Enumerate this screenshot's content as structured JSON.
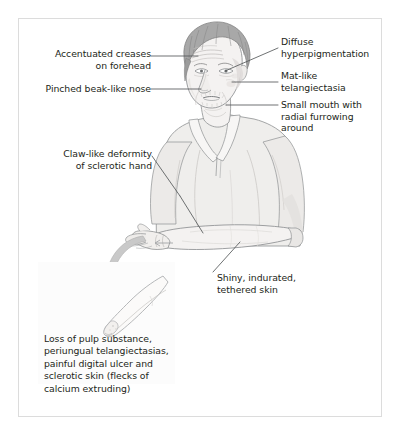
{
  "figure": {
    "type": "medical-illustration"
  },
  "colors": {
    "text": "#231f20",
    "leader_line": "#55585a",
    "frame_border": "#dcdcdc",
    "skin_fill": "#f4f2f1",
    "skin_shade": "#e3e0de",
    "hair_fill": "#a8a8a8",
    "hair_shade": "#8d8d8d",
    "shirt_fill": "#efeeec",
    "shirt_shade": "#dfdedb",
    "outline": "#8e9092",
    "arrow_fill": "#c9c9c9",
    "inset_bg": "#fcfcfc",
    "page_bg": "#ffffff"
  },
  "labels": {
    "forehead": {
      "text": "Accentuated creases\non forehead",
      "align": "right"
    },
    "nose": {
      "text": "Pinched beak-like nose",
      "align": "right"
    },
    "hand": {
      "text": "Claw-like deformity\nof sclerotic hand",
      "align": "right"
    },
    "hyperpigmentation": {
      "text": "Diffuse\nhyperpigmentation",
      "align": "left"
    },
    "telangiectasia": {
      "text": "Mat-like\ntelangiectasia",
      "align": "left"
    },
    "mouth": {
      "text": "Small mouth with\nradial furrowing\naround",
      "align": "left"
    },
    "skin": {
      "text": "Shiny, indurated,\ntethered skin",
      "align": "left"
    }
  },
  "inset": {
    "caption": "Loss of pulp substance,\nperiungual telangiectasias,\npainful digital ulcer and\nsclerotic skin (flecks of\ncalcium extruding)",
    "depicts": "finger-tip-with-digital-ulcer"
  }
}
